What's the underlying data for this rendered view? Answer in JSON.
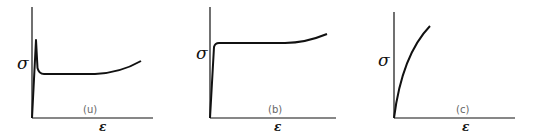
{
  "figure": {
    "panels": [
      {
        "id": "a",
        "label": "(u)",
        "y_label": "σ",
        "x_label": "ε",
        "description": "Stress-strain curve with sharp upper yield point, drop to lower yield plateau, then strain hardening"
      },
      {
        "id": "b",
        "label": "(b)",
        "y_label": "σ",
        "x_label": "ε",
        "description": "Stress-strain curve with elastic rise to flat yield plateau followed by mild strain hardening"
      },
      {
        "id": "c",
        "label": "(c)",
        "y_label": "σ",
        "x_label": "ε",
        "description": "Stress-strain curve with continuous parabolic hardening, no distinct yield point"
      }
    ]
  },
  "colors": {
    "ink": "#111111",
    "label": "#666666",
    "background": "#ffffff"
  }
}
